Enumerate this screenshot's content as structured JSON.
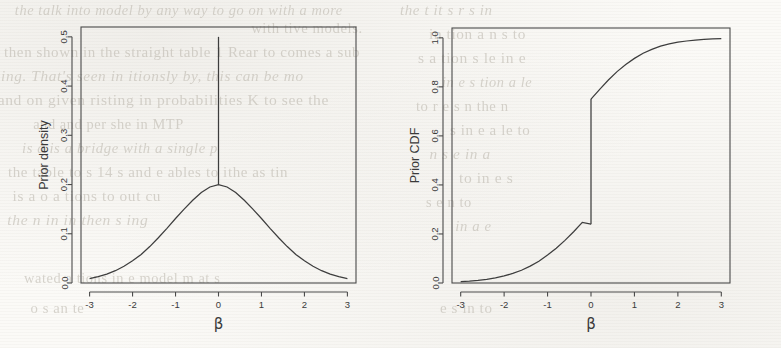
{
  "figure": {
    "background_color": "#fbfaf7",
    "ink_color": "#3d3d3d",
    "panel_count": 2
  },
  "ghost_text": {
    "note": "faint bleed-through text from the reverse side of the scanned page",
    "lines": [
      {
        "text": "the talk into model by any way to go on with a more",
        "x": 8,
        "y": 2,
        "size": 15
      },
      {
        "text": "with tive models.",
        "x": 250,
        "y": 20,
        "size": 15
      },
      {
        "text": "then shown in the straight table 1 Rear to comes a sub",
        "x": 4,
        "y": 44,
        "size": 15
      },
      {
        "text": "ing. That's seen in    itionsly by, this   can be mo",
        "x": 4,
        "y": 68,
        "size": 15
      },
      {
        "text": "and on given    risting in probabilities K   to see the",
        "x": 4,
        "y": 92,
        "size": 15
      },
      {
        "text": "and and per    she in    MTP",
        "x": 30,
        "y": 116,
        "size": 15
      },
      {
        "text": "is a     is a bridge      with a single      p",
        "x": 20,
        "y": 140,
        "size": 15
      },
      {
        "text": "the table      to s 14 s    and    e ables    to    ithe as tin",
        "x": 8,
        "y": 164,
        "size": 15
      },
      {
        "text": "is a      o a      tions to    out    cu",
        "x": 14,
        "y": 188,
        "size": 15
      },
      {
        "text": "the        n in        in then    s   ing",
        "x": 10,
        "y": 212,
        "size": 15
      },
      {
        "text": "wated a tions    in   e model    m at s",
        "x": 20,
        "y": 270,
        "size": 15
      },
      {
        "text": "o    s   an    te",
        "x": 30,
        "y": 300,
        "size": 15
      },
      {
        "text": "the   t   it   s   r    s   in",
        "x": 400,
        "y": 2,
        "size": 15
      },
      {
        "text": "in    tion     a   n   s    to",
        "x": 430,
        "y": 26,
        "size": 15
      },
      {
        "text": "s   a   tion   s   le   in   e",
        "x": 420,
        "y": 50,
        "size": 15
      },
      {
        "text": "in  e   s   tion   a   le",
        "x": 440,
        "y": 74,
        "size": 15
      },
      {
        "text": "to  r  e   s   n  the   n",
        "x": 415,
        "y": 98,
        "size": 15
      },
      {
        "text": "s   in   e   a   le   to",
        "x": 450,
        "y": 122,
        "size": 15
      },
      {
        "text": "n   s   e   in   a",
        "x": 430,
        "y": 146,
        "size": 15
      },
      {
        "text": "to   in    e   s",
        "x": 460,
        "y": 170,
        "size": 15
      },
      {
        "text": "s    e    n    to",
        "x": 425,
        "y": 194,
        "size": 15
      },
      {
        "text": "in    a    e",
        "x": 455,
        "y": 218,
        "size": 15
      },
      {
        "text": "e   s   in    to",
        "x": 440,
        "y": 300,
        "size": 15
      }
    ]
  },
  "chart_data": [
    {
      "type": "line",
      "name": "prior-density",
      "title": "",
      "xlabel": "β",
      "ylabel": "Prior density",
      "xlim": [
        -3.2,
        3.2
      ],
      "ylim": [
        0.0,
        0.52
      ],
      "xticks": [
        -3,
        -2,
        -1,
        0,
        1,
        2,
        3
      ],
      "xticklabels": [
        "-3",
        "-2",
        "-1",
        "0",
        "1",
        "2",
        "3"
      ],
      "yticks": [
        0.0,
        0.1,
        0.2,
        0.3,
        0.4,
        0.5
      ],
      "yticklabels": [
        "0.0",
        "0.1",
        "0.2",
        "0.3",
        "0.4",
        "0.5"
      ],
      "grid": false,
      "legend": "none",
      "description": "Spike-and-slab prior: a normal slab density peaking at 0.20 at beta=0, plus a point-mass spike drawn as a vertical line at beta=0 reaching 0.50.",
      "series": [
        {
          "name": "slab density",
          "x": [
            -3.0,
            -2.8,
            -2.6,
            -2.4,
            -2.2,
            -2.0,
            -1.8,
            -1.6,
            -1.4,
            -1.2,
            -1.0,
            -0.8,
            -0.6,
            -0.4,
            -0.2,
            0.0,
            0.2,
            0.4,
            0.6,
            0.8,
            1.0,
            1.2,
            1.4,
            1.6,
            1.8,
            2.0,
            2.2,
            2.4,
            2.6,
            2.8,
            3.0
          ],
          "y": [
            0.009,
            0.013,
            0.018,
            0.025,
            0.034,
            0.045,
            0.058,
            0.074,
            0.092,
            0.111,
            0.131,
            0.15,
            0.168,
            0.184,
            0.195,
            0.2,
            0.195,
            0.184,
            0.168,
            0.15,
            0.131,
            0.111,
            0.092,
            0.074,
            0.058,
            0.045,
            0.034,
            0.025,
            0.018,
            0.013,
            0.009
          ]
        },
        {
          "name": "point-mass spike",
          "x": [
            0.0,
            0.0
          ],
          "y": [
            0.2,
            0.5
          ]
        }
      ]
    },
    {
      "type": "line",
      "name": "prior-cdf",
      "title": "",
      "xlabel": "β",
      "ylabel": "Prior CDF",
      "xlim": [
        -3.2,
        3.2
      ],
      "ylim": [
        0.0,
        1.04
      ],
      "xticks": [
        -3,
        -2,
        -1,
        0,
        1,
        2,
        3
      ],
      "xticklabels": [
        "-3",
        "-2",
        "-1",
        "0",
        "1",
        "2",
        "3"
      ],
      "yticks": [
        0.0,
        0.2,
        0.4,
        0.6,
        0.8,
        1.0
      ],
      "yticklabels": [
        "0.0",
        "0.2",
        "0.4",
        "0.6",
        "0.8",
        "1.0"
      ],
      "grid": false,
      "legend": "none",
      "description": "CDF of the spike-and-slab prior, with a jump discontinuity at beta=0 from 0.24 up to 0.75.",
      "jump": {
        "x": 0.0,
        "from": 0.24,
        "to": 0.75
      },
      "series": [
        {
          "name": "CDF left branch",
          "x": [
            -3.0,
            -2.8,
            -2.6,
            -2.4,
            -2.2,
            -2.0,
            -1.8,
            -1.6,
            -1.4,
            -1.2,
            -1.0,
            -0.8,
            -0.6,
            -0.4,
            -0.2,
            0.0
          ],
          "y": [
            0.006,
            0.008,
            0.011,
            0.015,
            0.021,
            0.029,
            0.039,
            0.052,
            0.069,
            0.089,
            0.114,
            0.142,
            0.174,
            0.209,
            0.247,
            0.24
          ]
        },
        {
          "name": "CDF right branch",
          "x": [
            0.0,
            0.2,
            0.4,
            0.6,
            0.8,
            1.0,
            1.2,
            1.4,
            1.6,
            1.8,
            2.0,
            2.2,
            2.4,
            2.6,
            2.8,
            3.0
          ],
          "y": [
            0.75,
            0.79,
            0.828,
            0.862,
            0.891,
            0.916,
            0.937,
            0.953,
            0.966,
            0.975,
            0.982,
            0.987,
            0.991,
            0.994,
            0.996,
            0.997
          ]
        }
      ]
    }
  ]
}
